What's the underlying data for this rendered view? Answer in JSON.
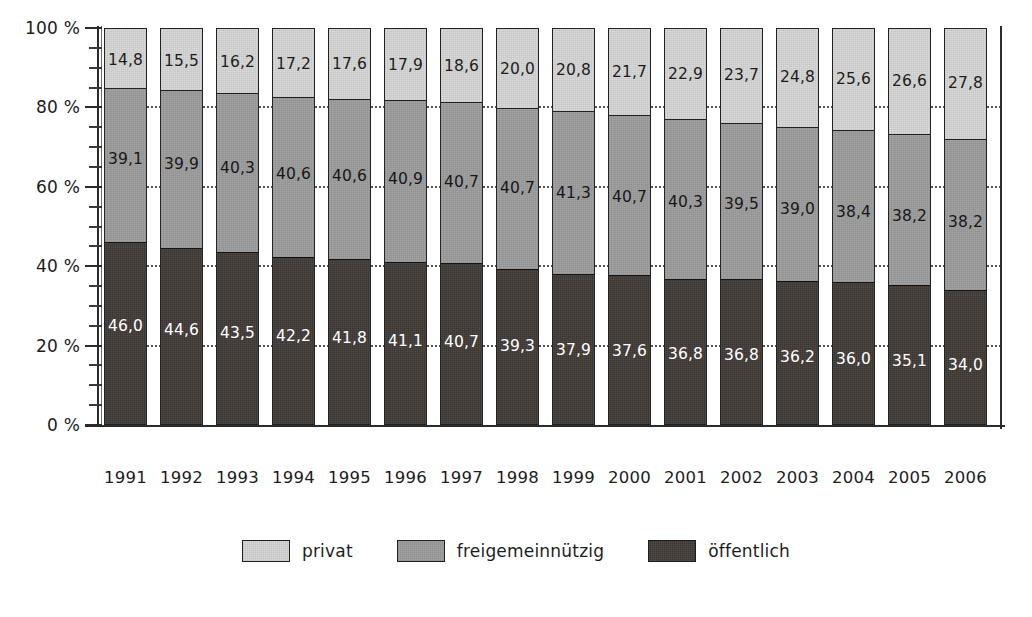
{
  "chart_data": {
    "type": "bar",
    "subtype": "stacked-percent-column",
    "title": "",
    "xlabel": "",
    "ylabel": "",
    "ylim": [
      0,
      100
    ],
    "y_unit": "%",
    "y_tick_labels": [
      "0 %",
      "20 %",
      "40 %",
      "60 %",
      "80 %",
      "100 %"
    ],
    "y_ticks": [
      0,
      20,
      40,
      60,
      80,
      100
    ],
    "y_minor_tick_step": 5,
    "grid": "dotted-between-bars",
    "legend_position": "bottom-center",
    "categories": [
      "1991",
      "1992",
      "1993",
      "1994",
      "1995",
      "1996",
      "1997",
      "1998",
      "1999",
      "2000",
      "2001",
      "2002",
      "2003",
      "2004",
      "2005",
      "2006"
    ],
    "series": [
      {
        "name": "privat",
        "color": "#d9d9d9",
        "values": [
          14.8,
          15.5,
          16.2,
          17.2,
          17.6,
          17.9,
          18.6,
          20.0,
          20.8,
          21.7,
          22.9,
          23.7,
          24.8,
          25.6,
          26.6,
          27.8
        ],
        "labels": [
          "14,8",
          "15,5",
          "16,2",
          "17,2",
          "17,6",
          "17,9",
          "18,6",
          "20,0",
          "20,8",
          "21,7",
          "22,9",
          "23,7",
          "24,8",
          "25,6",
          "26,6",
          "27,8"
        ]
      },
      {
        "name": "freigemeinnützig",
        "color": "#a2a2a2",
        "values": [
          39.1,
          39.9,
          40.3,
          40.6,
          40.6,
          40.9,
          40.7,
          40.7,
          41.3,
          40.7,
          40.3,
          39.5,
          39.0,
          38.4,
          38.2,
          38.2
        ],
        "labels": [
          "39,1",
          "39,9",
          "40,3",
          "40,6",
          "40,6",
          "40,9",
          "40,7",
          "40,7",
          "41,3",
          "40,7",
          "40,3",
          "39,5",
          "39,0",
          "38,4",
          "38,2",
          "38,2"
        ]
      },
      {
        "name": "öffentlich",
        "color": "#3b3531",
        "values": [
          46.0,
          44.6,
          43.5,
          42.2,
          41.8,
          41.1,
          40.7,
          39.3,
          37.9,
          37.6,
          36.8,
          36.8,
          36.2,
          36.0,
          35.1,
          34.0
        ],
        "labels": [
          "46,0",
          "44,6",
          "43,5",
          "42,2",
          "41,8",
          "41,1",
          "40,7",
          "39,3",
          "37,9",
          "37,6",
          "36,8",
          "36,8",
          "36,2",
          "36,0",
          "35,1",
          "34,0"
        ]
      }
    ],
    "stack_order_top_to_bottom": [
      "privat",
      "freigemeinnützig",
      "öffentlich"
    ]
  },
  "legend": {
    "items": [
      {
        "label": "privat",
        "color": "#d9d9d9"
      },
      {
        "label": "freigemeinnützig",
        "color": "#a2a2a2"
      },
      {
        "label": "öffentlich",
        "color": "#3b3531"
      }
    ]
  }
}
